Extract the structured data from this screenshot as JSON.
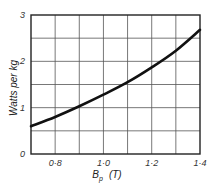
{
  "chart_data": {
    "type": "line",
    "title": "",
    "xlabel": "B_p (T)",
    "xlabel_main": "B",
    "xlabel_sub": "p",
    "xlabel_unit": "(T)",
    "ylabel": "Watts per kg",
    "xlim": [
      0.7,
      1.4
    ],
    "ylim": [
      0,
      3
    ],
    "grid": true,
    "x_ticks": [
      0.8,
      1.0,
      1.2,
      1.4
    ],
    "x_tick_labels": [
      "0·8",
      "1·0",
      "1·2",
      "1·4"
    ],
    "y_ticks": [
      0,
      1,
      2,
      3
    ],
    "y_tick_labels": [
      "0",
      "1",
      "2",
      "3"
    ],
    "x_gridlines": [
      0.8,
      0.9,
      1.0,
      1.1,
      1.2,
      1.3
    ],
    "y_gridlines": [
      0.5,
      1.0,
      1.5,
      2.0,
      2.5
    ],
    "series": [
      {
        "name": "Core loss",
        "x": [
          0.7,
          0.8,
          0.9,
          1.0,
          1.1,
          1.2,
          1.3,
          1.4
        ],
        "values": [
          0.6,
          0.8,
          1.03,
          1.28,
          1.55,
          1.87,
          2.23,
          2.68
        ]
      }
    ],
    "legend": null
  }
}
